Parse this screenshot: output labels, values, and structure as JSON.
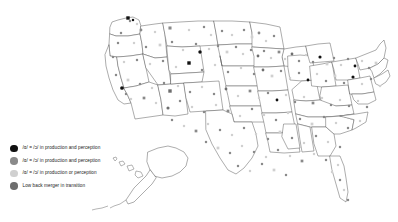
{
  "figure": {
    "background_color": "#ffffff",
    "outline_color": "#5a5a5a"
  },
  "legend": {
    "position": "bottom-left",
    "items": [
      {
        "id": "merged-production-perception",
        "label": "/ɑ/ = /ɔ/ in production and perception",
        "color": "#111111",
        "marker": "filled-dark-circle"
      },
      {
        "id": "merged-production-and-perception-mid",
        "label": "/ɑ/ = /ɔ/ in production and perception",
        "color": "#8a8a8a",
        "marker": "filled-gray-circle"
      },
      {
        "id": "merged-production-or-perception",
        "label": "/ɑ/ = /ɔ/ in production or perception",
        "color": "#d0d0d0",
        "marker": "filled-light-circle"
      },
      {
        "id": "merger-in-transition",
        "label": "Low back merger in transition",
        "color": "#6e6e6e",
        "marker": "filled-medium-circle"
      }
    ]
  },
  "chart_data": {
    "type": "map",
    "projection": "albers-usa",
    "grid": false,
    "legend_position": "bottom-left",
    "categories": [
      "/ɑ/ = /ɔ/ in production and perception",
      "/ɑ/ = /ɔ/ in production and perception",
      "/ɑ/ = /ɔ/ in production or perception",
      "Low back merger in transition"
    ],
    "category_colors": [
      "#111111",
      "#8a8a8a",
      "#d0d0d0",
      "#6e6e6e"
    ],
    "xlabel": "",
    "ylabel": "",
    "points": [
      {
        "x": 128,
        "y": 18,
        "c": 0,
        "s": 2.0
      },
      {
        "x": 130,
        "y": 21,
        "c": 1,
        "s": 1.6
      },
      {
        "x": 133,
        "y": 20,
        "c": 0,
        "s": 1.6
      },
      {
        "x": 137,
        "y": 24,
        "c": 2,
        "s": 1.6
      },
      {
        "x": 121,
        "y": 33,
        "c": 1,
        "s": 1.6
      },
      {
        "x": 141,
        "y": 30,
        "c": 1,
        "s": 1.8
      },
      {
        "x": 155,
        "y": 32,
        "c": 2,
        "s": 1.6
      },
      {
        "x": 170,
        "y": 28,
        "c": 1,
        "s": 1.8
      },
      {
        "x": 189,
        "y": 30,
        "c": 2,
        "s": 1.6
      },
      {
        "x": 204,
        "y": 27,
        "c": 1,
        "s": 1.6
      },
      {
        "x": 211,
        "y": 35,
        "c": 2,
        "s": 1.6
      },
      {
        "x": 222,
        "y": 31,
        "c": 1,
        "s": 1.6
      },
      {
        "x": 232,
        "y": 35,
        "c": 2,
        "s": 1.6
      },
      {
        "x": 244,
        "y": 30,
        "c": 1,
        "s": 1.6
      },
      {
        "x": 252,
        "y": 37,
        "c": 2,
        "s": 1.6
      },
      {
        "x": 259,
        "y": 33,
        "c": 1,
        "s": 1.8
      },
      {
        "x": 266,
        "y": 41,
        "c": 2,
        "s": 1.6
      },
      {
        "x": 274,
        "y": 36,
        "c": 1,
        "s": 1.6
      },
      {
        "x": 118,
        "y": 43,
        "c": 1,
        "s": 1.6
      },
      {
        "x": 134,
        "y": 43,
        "c": 2,
        "s": 1.6
      },
      {
        "x": 146,
        "y": 47,
        "c": 1,
        "s": 1.6
      },
      {
        "x": 160,
        "y": 45,
        "c": 2,
        "s": 1.6
      },
      {
        "x": 172,
        "y": 42,
        "c": 1,
        "s": 1.6
      },
      {
        "x": 183,
        "y": 50,
        "c": 2,
        "s": 1.6
      },
      {
        "x": 196,
        "y": 44,
        "c": 1,
        "s": 1.6
      },
      {
        "x": 200,
        "y": 52,
        "c": 0,
        "s": 2.2
      },
      {
        "x": 209,
        "y": 49,
        "c": 2,
        "s": 1.6
      },
      {
        "x": 218,
        "y": 46,
        "c": 1,
        "s": 1.6
      },
      {
        "x": 227,
        "y": 52,
        "c": 2,
        "s": 1.6
      },
      {
        "x": 236,
        "y": 47,
        "c": 1,
        "s": 1.6
      },
      {
        "x": 243,
        "y": 54,
        "c": 2,
        "s": 1.6
      },
      {
        "x": 251,
        "y": 50,
        "c": 1,
        "s": 1.6
      },
      {
        "x": 258,
        "y": 56,
        "c": 3,
        "s": 1.8
      },
      {
        "x": 264,
        "y": 51,
        "c": 1,
        "s": 1.6
      },
      {
        "x": 271,
        "y": 58,
        "c": 2,
        "s": 1.6
      },
      {
        "x": 279,
        "y": 52,
        "c": 1,
        "s": 1.6
      },
      {
        "x": 285,
        "y": 59,
        "c": 2,
        "s": 1.6
      },
      {
        "x": 292,
        "y": 54,
        "c": 3,
        "s": 1.8
      },
      {
        "x": 299,
        "y": 61,
        "c": 1,
        "s": 1.6
      },
      {
        "x": 306,
        "y": 55,
        "c": 2,
        "s": 1.6
      },
      {
        "x": 313,
        "y": 62,
        "c": 1,
        "s": 1.6
      },
      {
        "x": 320,
        "y": 57,
        "c": 0,
        "s": 2.0
      },
      {
        "x": 327,
        "y": 64,
        "c": 2,
        "s": 1.6
      },
      {
        "x": 334,
        "y": 58,
        "c": 1,
        "s": 1.6
      },
      {
        "x": 341,
        "y": 65,
        "c": 2,
        "s": 1.6
      },
      {
        "x": 348,
        "y": 59,
        "c": 1,
        "s": 1.6
      },
      {
        "x": 355,
        "y": 66,
        "c": 0,
        "s": 1.8
      },
      {
        "x": 362,
        "y": 61,
        "c": 2,
        "s": 1.6
      },
      {
        "x": 369,
        "y": 68,
        "c": 1,
        "s": 1.6
      },
      {
        "x": 376,
        "y": 63,
        "c": 2,
        "s": 1.6
      },
      {
        "x": 113,
        "y": 57,
        "c": 1,
        "s": 1.6
      },
      {
        "x": 124,
        "y": 62,
        "c": 2,
        "s": 1.6
      },
      {
        "x": 137,
        "y": 60,
        "c": 1,
        "s": 1.6
      },
      {
        "x": 150,
        "y": 64,
        "c": 2,
        "s": 1.6
      },
      {
        "x": 163,
        "y": 61,
        "c": 1,
        "s": 1.6
      },
      {
        "x": 176,
        "y": 67,
        "c": 2,
        "s": 1.6
      },
      {
        "x": 189,
        "y": 63,
        "c": 0,
        "s": 2.0
      },
      {
        "x": 202,
        "y": 70,
        "c": 1,
        "s": 1.6
      },
      {
        "x": 215,
        "y": 65,
        "c": 2,
        "s": 1.6
      },
      {
        "x": 228,
        "y": 72,
        "c": 1,
        "s": 1.6
      },
      {
        "x": 241,
        "y": 68,
        "c": 2,
        "s": 1.6
      },
      {
        "x": 254,
        "y": 74,
        "c": 1,
        "s": 1.6
      },
      {
        "x": 263,
        "y": 70,
        "c": 3,
        "s": 1.8
      },
      {
        "x": 272,
        "y": 76,
        "c": 2,
        "s": 1.6
      },
      {
        "x": 281,
        "y": 71,
        "c": 1,
        "s": 1.6
      },
      {
        "x": 290,
        "y": 78,
        "c": 2,
        "s": 1.6
      },
      {
        "x": 299,
        "y": 73,
        "c": 1,
        "s": 1.6
      },
      {
        "x": 308,
        "y": 80,
        "c": 0,
        "s": 1.8
      },
      {
        "x": 317,
        "y": 74,
        "c": 2,
        "s": 1.6
      },
      {
        "x": 326,
        "y": 81,
        "c": 1,
        "s": 1.6
      },
      {
        "x": 335,
        "y": 76,
        "c": 2,
        "s": 1.6
      },
      {
        "x": 344,
        "y": 83,
        "c": 1,
        "s": 1.6
      },
      {
        "x": 353,
        "y": 77,
        "c": 0,
        "s": 2.0
      },
      {
        "x": 362,
        "y": 84,
        "c": 2,
        "s": 1.6
      },
      {
        "x": 371,
        "y": 79,
        "c": 1,
        "s": 1.6
      },
      {
        "x": 380,
        "y": 86,
        "c": 2,
        "s": 1.6
      },
      {
        "x": 116,
        "y": 75,
        "c": 1,
        "s": 1.6
      },
      {
        "x": 128,
        "y": 80,
        "c": 2,
        "s": 1.6
      },
      {
        "x": 122,
        "y": 88,
        "c": 0,
        "s": 2.4
      },
      {
        "x": 126,
        "y": 94,
        "c": 1,
        "s": 1.6
      },
      {
        "x": 131,
        "y": 99,
        "c": 2,
        "s": 1.6
      },
      {
        "x": 140,
        "y": 84,
        "c": 1,
        "s": 1.6
      },
      {
        "x": 152,
        "y": 88,
        "c": 2,
        "s": 1.6
      },
      {
        "x": 164,
        "y": 83,
        "c": 1,
        "s": 1.6
      },
      {
        "x": 170,
        "y": 91,
        "c": 3,
        "s": 2.0
      },
      {
        "x": 178,
        "y": 86,
        "c": 2,
        "s": 1.6
      },
      {
        "x": 190,
        "y": 92,
        "c": 1,
        "s": 1.6
      },
      {
        "x": 202,
        "y": 87,
        "c": 2,
        "s": 1.6
      },
      {
        "x": 214,
        "y": 94,
        "c": 1,
        "s": 1.6
      },
      {
        "x": 226,
        "y": 89,
        "c": 3,
        "s": 1.8
      },
      {
        "x": 238,
        "y": 96,
        "c": 2,
        "s": 1.6
      },
      {
        "x": 250,
        "y": 91,
        "c": 1,
        "s": 1.6
      },
      {
        "x": 259,
        "y": 98,
        "c": 2,
        "s": 1.6
      },
      {
        "x": 268,
        "y": 93,
        "c": 1,
        "s": 1.6
      },
      {
        "x": 277,
        "y": 100,
        "c": 0,
        "s": 1.8
      },
      {
        "x": 286,
        "y": 95,
        "c": 2,
        "s": 1.6
      },
      {
        "x": 295,
        "y": 102,
        "c": 1,
        "s": 1.6
      },
      {
        "x": 304,
        "y": 97,
        "c": 2,
        "s": 1.6
      },
      {
        "x": 313,
        "y": 103,
        "c": 1,
        "s": 1.6
      },
      {
        "x": 322,
        "y": 98,
        "c": 2,
        "s": 1.6
      },
      {
        "x": 331,
        "y": 105,
        "c": 1,
        "s": 1.6
      },
      {
        "x": 340,
        "y": 100,
        "c": 2,
        "s": 1.6
      },
      {
        "x": 349,
        "y": 106,
        "c": 1,
        "s": 1.6
      },
      {
        "x": 358,
        "y": 101,
        "c": 2,
        "s": 1.6
      },
      {
        "x": 367,
        "y": 107,
        "c": 1,
        "s": 1.6
      },
      {
        "x": 144,
        "y": 98,
        "c": 1,
        "s": 1.6
      },
      {
        "x": 156,
        "y": 103,
        "c": 2,
        "s": 1.6
      },
      {
        "x": 168,
        "y": 108,
        "c": 3,
        "s": 2.0
      },
      {
        "x": 180,
        "y": 101,
        "c": 1,
        "s": 1.6
      },
      {
        "x": 192,
        "y": 107,
        "c": 2,
        "s": 1.6
      },
      {
        "x": 204,
        "y": 112,
        "c": 1,
        "s": 1.6
      },
      {
        "x": 216,
        "y": 105,
        "c": 2,
        "s": 1.6
      },
      {
        "x": 228,
        "y": 111,
        "c": 1,
        "s": 1.6
      },
      {
        "x": 240,
        "y": 116,
        "c": 2,
        "s": 1.6
      },
      {
        "x": 252,
        "y": 109,
        "c": 1,
        "s": 1.6
      },
      {
        "x": 264,
        "y": 115,
        "c": 2,
        "s": 1.6
      },
      {
        "x": 276,
        "y": 120,
        "c": 1,
        "s": 1.6
      },
      {
        "x": 288,
        "y": 113,
        "c": 2,
        "s": 1.6
      },
      {
        "x": 300,
        "y": 119,
        "c": 1,
        "s": 1.6
      },
      {
        "x": 312,
        "y": 124,
        "c": 2,
        "s": 1.6
      },
      {
        "x": 324,
        "y": 117,
        "c": 1,
        "s": 1.6
      },
      {
        "x": 336,
        "y": 123,
        "c": 2,
        "s": 1.6
      },
      {
        "x": 348,
        "y": 128,
        "c": 1,
        "s": 1.6
      },
      {
        "x": 360,
        "y": 121,
        "c": 2,
        "s": 1.6
      },
      {
        "x": 172,
        "y": 120,
        "c": 1,
        "s": 1.6
      },
      {
        "x": 184,
        "y": 126,
        "c": 2,
        "s": 1.6
      },
      {
        "x": 196,
        "y": 131,
        "c": 1,
        "s": 1.6
      },
      {
        "x": 208,
        "y": 124,
        "c": 2,
        "s": 1.6
      },
      {
        "x": 220,
        "y": 130,
        "c": 1,
        "s": 1.6
      },
      {
        "x": 232,
        "y": 135,
        "c": 2,
        "s": 1.6
      },
      {
        "x": 244,
        "y": 128,
        "c": 1,
        "s": 1.6
      },
      {
        "x": 256,
        "y": 134,
        "c": 2,
        "s": 1.6
      },
      {
        "x": 268,
        "y": 139,
        "c": 1,
        "s": 1.6
      },
      {
        "x": 280,
        "y": 132,
        "c": 2,
        "s": 1.6
      },
      {
        "x": 292,
        "y": 138,
        "c": 1,
        "s": 1.6
      },
      {
        "x": 304,
        "y": 143,
        "c": 2,
        "s": 1.6
      },
      {
        "x": 316,
        "y": 136,
        "c": 1,
        "s": 1.6
      },
      {
        "x": 328,
        "y": 142,
        "c": 2,
        "s": 1.6
      },
      {
        "x": 340,
        "y": 147,
        "c": 1,
        "s": 1.6
      },
      {
        "x": 206,
        "y": 142,
        "c": 1,
        "s": 1.6
      },
      {
        "x": 218,
        "y": 148,
        "c": 2,
        "s": 1.6
      },
      {
        "x": 230,
        "y": 153,
        "c": 1,
        "s": 1.6
      },
      {
        "x": 242,
        "y": 146,
        "c": 2,
        "s": 1.6
      },
      {
        "x": 254,
        "y": 152,
        "c": 1,
        "s": 1.6
      },
      {
        "x": 266,
        "y": 157,
        "c": 2,
        "s": 1.6
      },
      {
        "x": 278,
        "y": 150,
        "c": 1,
        "s": 1.6
      },
      {
        "x": 290,
        "y": 156,
        "c": 2,
        "s": 1.6
      },
      {
        "x": 302,
        "y": 161,
        "c": 1,
        "s": 1.6
      },
      {
        "x": 314,
        "y": 154,
        "c": 2,
        "s": 1.6
      },
      {
        "x": 326,
        "y": 160,
        "c": 1,
        "s": 1.6
      },
      {
        "x": 338,
        "y": 165,
        "c": 2,
        "s": 1.6
      },
      {
        "x": 238,
        "y": 166,
        "c": 1,
        "s": 1.6
      },
      {
        "x": 250,
        "y": 171,
        "c": 2,
        "s": 1.6
      },
      {
        "x": 262,
        "y": 164,
        "c": 1,
        "s": 1.6
      },
      {
        "x": 274,
        "y": 170,
        "c": 2,
        "s": 1.6
      },
      {
        "x": 286,
        "y": 175,
        "c": 1,
        "s": 1.6
      },
      {
        "x": 332,
        "y": 172,
        "c": 2,
        "s": 1.6
      },
      {
        "x": 340,
        "y": 180,
        "c": 1,
        "s": 1.6
      },
      {
        "x": 344,
        "y": 190,
        "c": 2,
        "s": 1.6
      },
      {
        "x": 348,
        "y": 200,
        "c": 1,
        "s": 1.6
      }
    ]
  }
}
